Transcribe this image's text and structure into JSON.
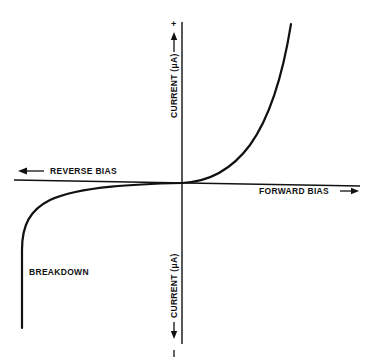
{
  "diagram": {
    "type": "diode-iv-characteristic",
    "colors": {
      "background": "#ffffff",
      "ink": "#111111"
    },
    "labels": {
      "current_positive": "CURRENT (μA)",
      "current_negative": "CURRENT (μA)",
      "reverse_bias": "REVERSE BIAS",
      "forward_bias": "FORWARD BIAS",
      "breakdown": "BREAKDOWN",
      "plus_sign": "+",
      "minus_sign": "−"
    },
    "arrows": {
      "up": "→",
      "down": "←",
      "left": "←",
      "right": "→"
    },
    "axes": {
      "horizontal": {
        "x1": 14,
        "y1": 180,
        "x2": 360,
        "y2": 186
      },
      "vertical": {
        "x1": 182,
        "y1": 22,
        "x2": 182,
        "y2": 344
      }
    },
    "curve": {
      "forward_path": "M 182 183 C 205 182, 230 172, 250 145 C 268 120, 282 80, 291 24",
      "reverse_path": "M 182 183 C 140 184, 80 186, 50 200 C 30 210, 22 225, 22 250 L 22 328"
    }
  }
}
